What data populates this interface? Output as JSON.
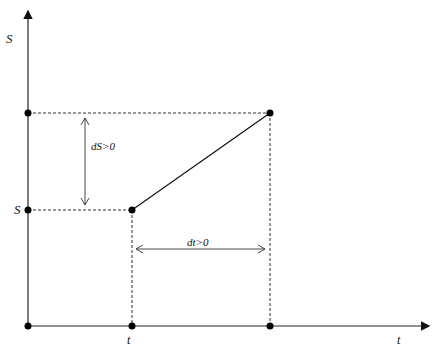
{
  "diagram": {
    "y_axis_label": "S",
    "x_axis_label": "t",
    "s_tick_label": "S",
    "t_tick_label": "t",
    "ds_label": "dS>0",
    "dt_label": "dt>0",
    "points": [
      {
        "name": "origin",
        "x": 28,
        "y": 326
      },
      {
        "name": "s-axis-upper",
        "x": 28,
        "y": 113
      },
      {
        "name": "s-axis-S",
        "x": 28,
        "y": 210
      },
      {
        "name": "start",
        "x": 132,
        "y": 210
      },
      {
        "name": "end",
        "x": 270,
        "y": 113
      },
      {
        "name": "t-axis-t",
        "x": 132,
        "y": 326
      },
      {
        "name": "t-axis-end",
        "x": 270,
        "y": 326
      }
    ]
  }
}
